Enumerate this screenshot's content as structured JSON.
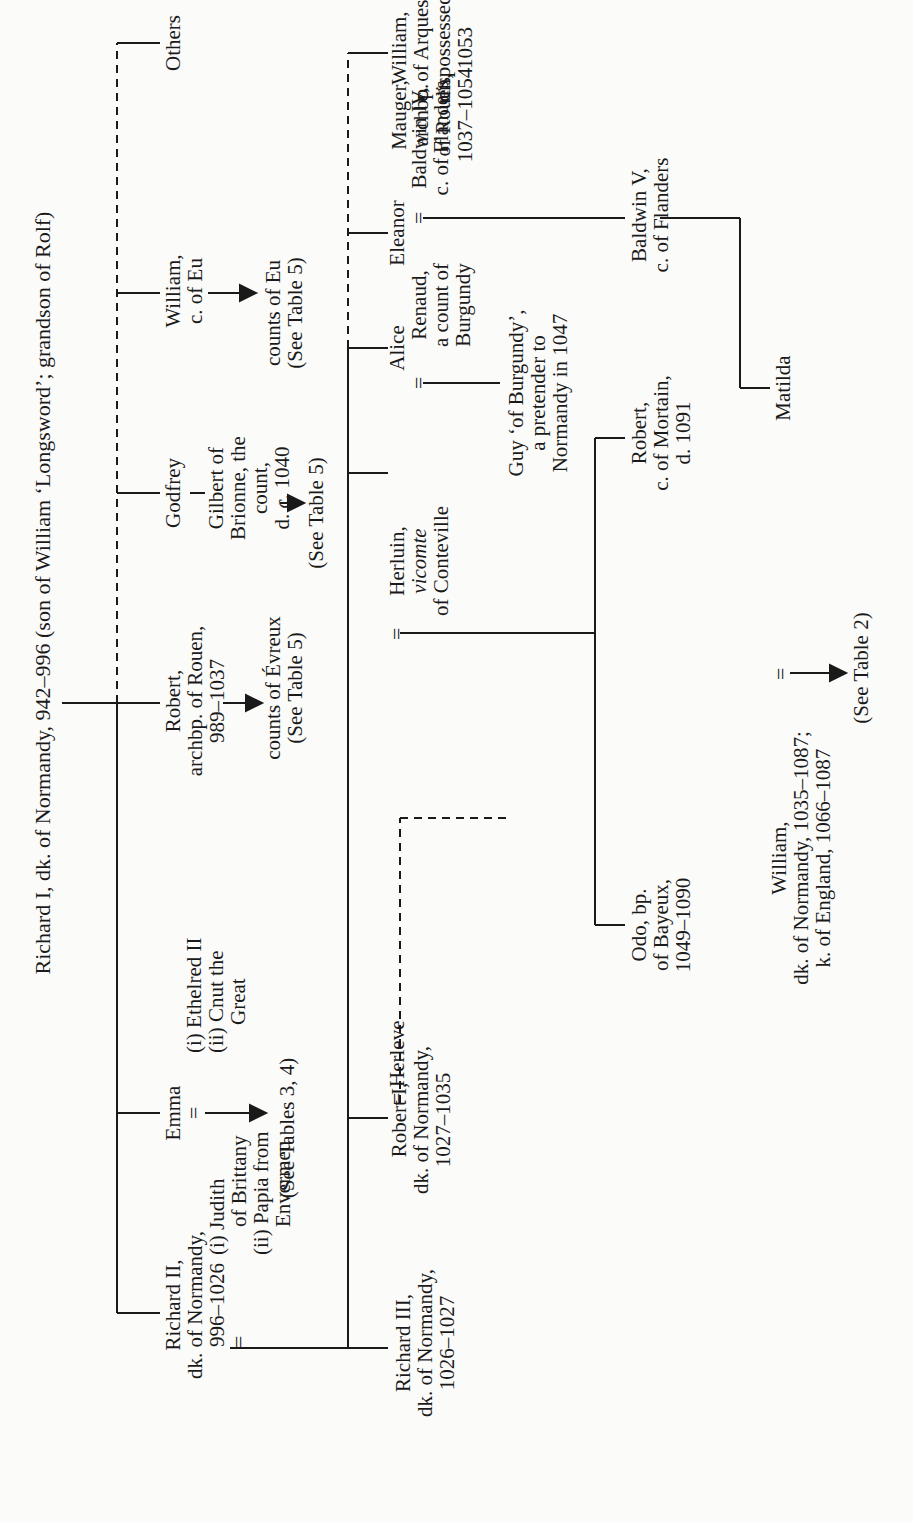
{
  "title": "Richard I, dk. of Normandy, 942–996 (son of William ‘Longsword’; grandson of Rolf)",
  "generation_2": {
    "richard_ii": [
      "Richard II,",
      "dk. of Normandy,",
      "996–1026"
    ],
    "richard_ii_spouses": [
      "(i) Judith",
      "of Brittany",
      "(ii) Papia from",
      "Envermeu"
    ],
    "emma": "Emma",
    "emma_spouses": [
      "(i) Ethelred II",
      "(ii) Cnut the",
      "Great"
    ],
    "emma_ref": "(See Tables 3, 4)",
    "robert_archbp": [
      "Robert,",
      "archbp. of Rouen,",
      "989–1037"
    ],
    "robert_desc": [
      "counts of Évreux",
      "(See Table 5)"
    ],
    "godfrey": "Godfrey",
    "gilbert": [
      "Gilbert of",
      "Brionne, the",
      "count,",
      "d. c. 1040"
    ],
    "gilbert_ref": "(See Table 5)",
    "william_eu": [
      "William,",
      "c. of Eu"
    ],
    "william_eu_desc": [
      "counts of Eu",
      "(See Table 5)"
    ],
    "others": "Others"
  },
  "generation_3": {
    "richard_iii": [
      "Richard III,",
      "dk. of Normandy,",
      "1026–1027"
    ],
    "robert_i": [
      "Robert I,",
      "dk. of Normandy,",
      "1027–1035"
    ],
    "herleve": "Herleve",
    "herluin": [
      "Herluin,",
      "vicomte",
      "of Conteville"
    ],
    "alice": "Alice",
    "renaud": [
      "Renaud,",
      "a count of",
      "Burgundy"
    ],
    "eleanor": "Eleanor",
    "baldwin_iv": [
      "Baldwin IV,",
      "c. of Flanders"
    ],
    "mauger": [
      "Mauger,",
      "archbp.",
      "of Rouen,",
      "1037–1054"
    ],
    "william_arques": [
      "William,",
      "c. of Arques,",
      "dispossessed",
      "1053"
    ]
  },
  "generation_4": {
    "guy": [
      "Guy ‘of Burgundy’,",
      "a pretender to",
      "Normandy in 1047"
    ],
    "odo": [
      "Odo, bp.",
      "of Bayeux,",
      "1049–1090"
    ],
    "robert_mortain": [
      "Robert,",
      "c. of Mortain,",
      "d. 1091"
    ],
    "baldwin_v": [
      "Baldwin V,",
      "c. of Flanders"
    ],
    "william_conqueror": [
      "William,",
      "dk. of Normandy, 1035–1087;",
      "k. of England, 1066–1087"
    ],
    "matilda": "Matilda",
    "table2_ref": "(See Table 2)"
  },
  "symbols": {
    "marriage": "="
  }
}
